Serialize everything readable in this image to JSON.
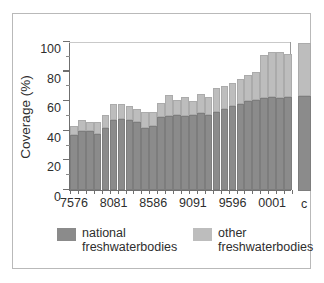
{
  "chart_data": {
    "type": "bar",
    "stacked": true,
    "title": "",
    "xlabel": "",
    "ylabel": "Coverage (%)",
    "ylim": [
      0,
      100
    ],
    "yticks": [
      0,
      20,
      40,
      60,
      80,
      100
    ],
    "ytick_labels": [
      "0",
      "20",
      "40",
      "60",
      "80",
      "100"
    ],
    "grid": false,
    "legend_position": "bottom",
    "categories": [
      "7576",
      "7677",
      "7778",
      "7879",
      "7980",
      "8081",
      "8182",
      "8283",
      "8384",
      "8485",
      "8586",
      "8687",
      "8788",
      "8889",
      "8990",
      "9091",
      "9192",
      "9293",
      "9394",
      "9495",
      "9596",
      "9697",
      "9798",
      "9899",
      "9900",
      "0001",
      "0102",
      "0203"
    ],
    "xtick_labels": [
      "7576",
      "8081",
      "8586",
      "9091",
      "9596",
      "0001"
    ],
    "xtick_indices": [
      0,
      5,
      10,
      15,
      20,
      25
    ],
    "series": [
      {
        "name": "national freshwaterbodies",
        "color": "#8b8b8b",
        "values": [
          37,
          40,
          40,
          38,
          42,
          47,
          48,
          47,
          46,
          42,
          43,
          49,
          50,
          51,
          50,
          51,
          52,
          51,
          53,
          55,
          57,
          58,
          60,
          61,
          62,
          63,
          62,
          63
        ]
      },
      {
        "name": "other freshwaterbodies",
        "color": "#bdbdbd",
        "values": [
          6,
          7,
          6,
          8,
          9,
          11,
          10,
          10,
          9,
          11,
          10,
          10,
          14,
          10,
          13,
          9,
          13,
          12,
          16,
          15,
          15,
          17,
          18,
          19,
          29,
          30,
          31,
          29
        ]
      }
    ],
    "totals": [
      43,
      47,
      46,
      46,
      51,
      58,
      58,
      57,
      55,
      53,
      53,
      59,
      64,
      61,
      63,
      60,
      65,
      63,
      69,
      70,
      72,
      75,
      78,
      80,
      91,
      93,
      93,
      92
    ],
    "extra_bar": {
      "category": "c",
      "label": "c",
      "national": 64,
      "other": 36,
      "total": 100,
      "outside_axes": true
    }
  },
  "legend": {
    "entries": [
      {
        "label_line1": "national",
        "label_line2": "freshwaterbodies",
        "color": "#8b8b8b"
      },
      {
        "label_line1": "other",
        "label_line2": "freshwaterbodies",
        "color": "#bdbdbd"
      }
    ]
  },
  "colors": {
    "national": "#8b8b8b",
    "other": "#bdbdbd",
    "axis": "#6f6f6f",
    "text": "#2e2e2e",
    "border": "#b9b9b9",
    "background": "#ffffff"
  }
}
